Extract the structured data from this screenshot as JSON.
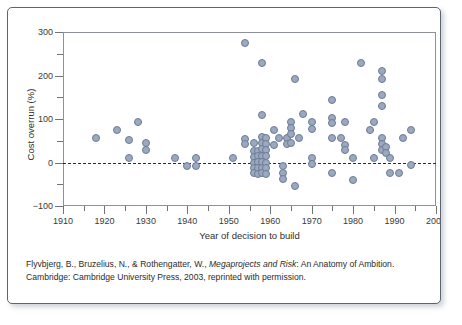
{
  "chart_data": {
    "type": "scatter",
    "title": "",
    "xlabel": "Year of decision to build",
    "ylabel": "Cost overrun (%)",
    "xlim": [
      1910,
      2000
    ],
    "ylim": [
      -100,
      300
    ],
    "xticks": [
      1910,
      1920,
      1930,
      1940,
      1950,
      1960,
      1970,
      1980,
      1990,
      2000
    ],
    "xticks_minor": [
      1915,
      1925,
      1935,
      1945,
      1955,
      1965,
      1975,
      1985,
      1995
    ],
    "yticks": [
      -100,
      0,
      100,
      200,
      300
    ],
    "yticks_minor": [
      -50,
      50,
      150,
      250
    ],
    "grid": false,
    "legend": null,
    "annotations": [
      {
        "type": "hline",
        "y": 0,
        "style": "dashed",
        "color": "#2b2b2b"
      }
    ],
    "marker": {
      "shape": "circle",
      "fill": "#9aa8c0",
      "edge": "#6d7b94",
      "size_px": 8
    },
    "points": [
      {
        "x": 1918,
        "y": 57
      },
      {
        "x": 1923,
        "y": 74
      },
      {
        "x": 1926,
        "y": 52
      },
      {
        "x": 1926,
        "y": 10
      },
      {
        "x": 1928,
        "y": 92
      },
      {
        "x": 1930,
        "y": 44
      },
      {
        "x": 1930,
        "y": 28
      },
      {
        "x": 1937,
        "y": 11
      },
      {
        "x": 1940,
        "y": -8
      },
      {
        "x": 1942,
        "y": 10
      },
      {
        "x": 1942,
        "y": -8
      },
      {
        "x": 1951,
        "y": 11
      },
      {
        "x": 1954,
        "y": 275
      },
      {
        "x": 1954,
        "y": 55
      },
      {
        "x": 1954,
        "y": 42
      },
      {
        "x": 1956,
        "y": 44
      },
      {
        "x": 1956,
        "y": 26
      },
      {
        "x": 1956,
        "y": 13
      },
      {
        "x": 1956,
        "y": 0
      },
      {
        "x": 1956,
        "y": -12
      },
      {
        "x": 1956,
        "y": -25
      },
      {
        "x": 1957,
        "y": 27
      },
      {
        "x": 1957,
        "y": 14
      },
      {
        "x": 1957,
        "y": 1
      },
      {
        "x": 1957,
        "y": -12
      },
      {
        "x": 1957,
        "y": -26
      },
      {
        "x": 1958,
        "y": 229
      },
      {
        "x": 1958,
        "y": 110
      },
      {
        "x": 1958,
        "y": 58
      },
      {
        "x": 1958,
        "y": 45
      },
      {
        "x": 1958,
        "y": 30
      },
      {
        "x": 1958,
        "y": 16
      },
      {
        "x": 1958,
        "y": 2
      },
      {
        "x": 1958,
        "y": -12
      },
      {
        "x": 1958,
        "y": -25
      },
      {
        "x": 1959,
        "y": 56
      },
      {
        "x": 1959,
        "y": 43
      },
      {
        "x": 1959,
        "y": 28
      },
      {
        "x": 1959,
        "y": 14
      },
      {
        "x": 1959,
        "y": 0
      },
      {
        "x": 1959,
        "y": -13
      },
      {
        "x": 1959,
        "y": -26
      },
      {
        "x": 1961,
        "y": 74
      },
      {
        "x": 1961,
        "y": 40
      },
      {
        "x": 1962,
        "y": 56
      },
      {
        "x": 1963,
        "y": -8
      },
      {
        "x": 1963,
        "y": -24
      },
      {
        "x": 1963,
        "y": -38
      },
      {
        "x": 1964,
        "y": 57
      },
      {
        "x": 1964,
        "y": 42
      },
      {
        "x": 1965,
        "y": 93
      },
      {
        "x": 1965,
        "y": 79
      },
      {
        "x": 1965,
        "y": 65
      },
      {
        "x": 1965,
        "y": 44
      },
      {
        "x": 1966,
        "y": 191
      },
      {
        "x": 1966,
        "y": -55
      },
      {
        "x": 1967,
        "y": 57
      },
      {
        "x": 1968,
        "y": 111
      },
      {
        "x": 1970,
        "y": 92
      },
      {
        "x": 1970,
        "y": 76
      },
      {
        "x": 1970,
        "y": 10
      },
      {
        "x": 1970,
        "y": -3
      },
      {
        "x": 1975,
        "y": 144
      },
      {
        "x": 1975,
        "y": 103
      },
      {
        "x": 1975,
        "y": 91
      },
      {
        "x": 1975,
        "y": 57
      },
      {
        "x": 1975,
        "y": -23
      },
      {
        "x": 1977,
        "y": 57
      },
      {
        "x": 1978,
        "y": 41
      },
      {
        "x": 1978,
        "y": 28
      },
      {
        "x": 1978,
        "y": 92
      },
      {
        "x": 1980,
        "y": 10
      },
      {
        "x": 1980,
        "y": -41
      },
      {
        "x": 1982,
        "y": 229
      },
      {
        "x": 1984,
        "y": 75
      },
      {
        "x": 1985,
        "y": 92
      },
      {
        "x": 1985,
        "y": 11
      },
      {
        "x": 1987,
        "y": 210
      },
      {
        "x": 1987,
        "y": 193
      },
      {
        "x": 1987,
        "y": 156
      },
      {
        "x": 1987,
        "y": 130
      },
      {
        "x": 1987,
        "y": 57
      },
      {
        "x": 1987,
        "y": 42
      },
      {
        "x": 1987,
        "y": 28
      },
      {
        "x": 1988,
        "y": 36
      },
      {
        "x": 1988,
        "y": 22
      },
      {
        "x": 1989,
        "y": 11
      },
      {
        "x": 1989,
        "y": -25
      },
      {
        "x": 1991,
        "y": -25
      },
      {
        "x": 1992,
        "y": 57
      },
      {
        "x": 1994,
        "y": 74
      },
      {
        "x": 1994,
        "y": -6
      }
    ]
  },
  "caption": {
    "part1": "Flyvbjerg, B., Bruzelius, N., & Rothengatter, W., ",
    "italic": "Megaprojects and Risk",
    "part2": ": An Anatomy of Ambition. Cambridge: Cambridge University Press, 2003, reprinted with permission."
  }
}
